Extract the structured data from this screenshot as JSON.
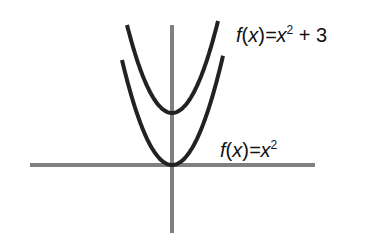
{
  "diagram": {
    "title": "",
    "axes": {
      "x_axis": {
        "x1": 30,
        "x2": 315,
        "y": 165,
        "color": "#808080"
      },
      "y_axis": {
        "x": 172,
        "y1": 25,
        "y2": 233,
        "color": "#808080"
      }
    },
    "curves": [
      {
        "name": "shifted-parabola",
        "label_func": "f",
        "label_var": "x",
        "label_eq": "=x",
        "label_exp": "2",
        "label_tail": " + 3",
        "vertex": [
          172,
          113
        ],
        "left_top": [
          127,
          25
        ],
        "right_top": [
          218,
          25
        ],
        "color": "#222222"
      },
      {
        "name": "base-parabola",
        "label_func": "f",
        "label_var": "x",
        "label_eq": "=x",
        "label_exp": "2",
        "label_tail": "",
        "vertex": [
          172,
          165
        ],
        "left_top": [
          122,
          60
        ],
        "right_top": [
          223,
          60
        ],
        "color": "#222222"
      }
    ]
  },
  "chart_data": {
    "type": "line",
    "title": "",
    "xlabel": "",
    "ylabel": "",
    "series": [
      {
        "name": "f(x)=x² + 3",
        "expression": "x^2 + 3",
        "vertex": [
          0,
          3
        ]
      },
      {
        "name": "f(x)=x²",
        "expression": "x^2",
        "vertex": [
          0,
          0
        ]
      }
    ],
    "grid": false,
    "legend": "inline labels"
  }
}
